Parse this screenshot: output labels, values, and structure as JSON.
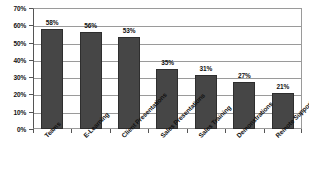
{
  "chart_data": {
    "type": "bar",
    "title": "",
    "subtitle": "",
    "xlabel": "",
    "ylabel": "",
    "ylim": [
      0,
      70
    ],
    "grid": true,
    "legend": false,
    "y_ticks": [
      "0%",
      "10%",
      "20%",
      "30%",
      "40%",
      "50%",
      "60%",
      "70%"
    ],
    "y_tick_values": [
      0,
      10,
      20,
      30,
      40,
      50,
      60,
      70
    ],
    "categories": [
      "Teams",
      "E-Learning",
      "Client Presentations",
      "Sales Presentations",
      "Sales Training",
      "Demonstrations",
      "Remote Support"
    ],
    "values": [
      58,
      56,
      53,
      35,
      31,
      27,
      21
    ],
    "data_labels": [
      "58%",
      "56%",
      "53%",
      "35%",
      "31%",
      "27%",
      "21%"
    ],
    "bar_color": "#464646",
    "bar_border_color": "#2e2e2e",
    "grid_color": "#9a9a9a",
    "axis_color": "#555555",
    "text_color": "#111111",
    "background_color": "#ffffff"
  }
}
